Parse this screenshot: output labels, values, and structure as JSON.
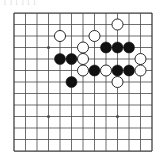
{
  "caption": {
    "text": "[ ] [ ] [ ]"
  },
  "board": {
    "title": "go-board-diagram",
    "cols": 13,
    "rows": 13,
    "line_color": "#4a4a4a",
    "border_color": "#3a3a3a",
    "background_color": "#ffffff",
    "black_color": "#111111",
    "white_color": "#ffffff",
    "white_outline_color": "#2b2b2b",
    "star_points": [
      {
        "col": 4,
        "row": 4
      },
      {
        "col": 10,
        "row": 4
      },
      {
        "col": 4,
        "row": 10
      },
      {
        "col": 10,
        "row": 10
      }
    ],
    "visible_star_points": [
      {
        "col": 4,
        "row": 4
      },
      {
        "col": 4,
        "row": 10
      },
      {
        "col": 10,
        "row": 10
      }
    ],
    "stones": [
      {
        "col": 10,
        "row": 2,
        "color": "white"
      },
      {
        "col": 5,
        "row": 3,
        "color": "white"
      },
      {
        "col": 8,
        "row": 3,
        "color": "white"
      },
      {
        "col": 7,
        "row": 4,
        "color": "white"
      },
      {
        "col": 9,
        "row": 4,
        "color": "black"
      },
      {
        "col": 10,
        "row": 4,
        "color": "black"
      },
      {
        "col": 11,
        "row": 4,
        "color": "black"
      },
      {
        "col": 5,
        "row": 5,
        "color": "black"
      },
      {
        "col": 6,
        "row": 5,
        "color": "black"
      },
      {
        "col": 7,
        "row": 5,
        "color": "white"
      },
      {
        "col": 12,
        "row": 5,
        "color": "white"
      },
      {
        "col": 7,
        "row": 6,
        "color": "white"
      },
      {
        "col": 8,
        "row": 6,
        "color": "black"
      },
      {
        "col": 9,
        "row": 6,
        "color": "white"
      },
      {
        "col": 10,
        "row": 6,
        "color": "black"
      },
      {
        "col": 11,
        "row": 6,
        "color": "black"
      },
      {
        "col": 12,
        "row": 6,
        "color": "white"
      },
      {
        "col": 6,
        "row": 7,
        "color": "black"
      },
      {
        "col": 10,
        "row": 7,
        "color": "white"
      }
    ],
    "counts": {
      "black_stones": 9,
      "white_stones": 10,
      "total_stones": 19
    }
  }
}
